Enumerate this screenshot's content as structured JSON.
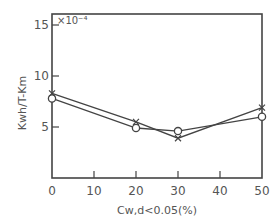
{
  "chart_data": {
    "type": "line",
    "title": "",
    "xlabel": "Cw,d<0.05(%)",
    "ylabel": "Kwh/T-Km",
    "y_scale_note": "×10⁻⁴",
    "xlim": [
      0,
      50
    ],
    "ylim": [
      0,
      16
    ],
    "x_ticks": [
      0,
      10,
      20,
      30,
      40,
      50
    ],
    "y_ticks": [
      5,
      10,
      15
    ],
    "x_tick_labels": [
      "0",
      "10",
      "20",
      "30",
      "40",
      "50"
    ],
    "y_tick_labels": [
      "5",
      "10",
      "15"
    ],
    "grid": false,
    "legend": null,
    "series": [
      {
        "name": "circle",
        "marker": "o",
        "x": [
          0,
          20,
          30,
          50
        ],
        "values": [
          7.8,
          4.9,
          4.6,
          6.0
        ]
      },
      {
        "name": "cross",
        "marker": "x",
        "x": [
          0,
          20,
          30,
          50
        ],
        "values": [
          8.3,
          5.5,
          3.9,
          6.9
        ]
      }
    ]
  },
  "colors": {
    "line": "#444444",
    "text": "#555555",
    "background": "#ffffff"
  }
}
